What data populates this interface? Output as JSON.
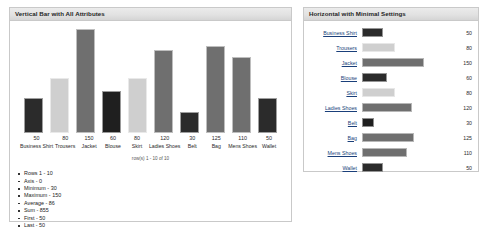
{
  "left_panel": {
    "title": "Vertical Bar with All Attributes",
    "row_count_text": "row(s) 1 - 10 of 10",
    "stats": [
      "Rows  1 - 10",
      "Axis - 0",
      "Minimum - 30",
      "Maximum - 150",
      "Average - 86",
      "Sum - 855",
      "First - 50",
      "Last - 50"
    ]
  },
  "right_panel": {
    "title": "Horizontal with Minimal Settings"
  },
  "colors": {
    "bar_dark": "#2b2b2b",
    "bar_light": "#cfcfcf",
    "bar_mid": "#6f6f6f",
    "bar_darker": "#1f1f1f",
    "panel_border": "#c9c9c9",
    "header_bg": "#e2e2e2",
    "link": "#1a3f7a"
  },
  "chart_data": [
    {
      "type": "bar",
      "orientation": "vertical",
      "title": "Vertical Bar with All Attributes",
      "xlabel": "",
      "ylabel": "",
      "ylim": [
        0,
        150
      ],
      "grid": false,
      "legend": "none",
      "categories": [
        "Business Shirt",
        "Trousers",
        "Jacket",
        "Blouse",
        "Skirt",
        "Ladies Shoes",
        "Belt",
        "Bag",
        "Mens Shoes",
        "Wallet"
      ],
      "values": [
        50,
        80,
        150,
        60,
        80,
        120,
        30,
        125,
        110,
        50
      ],
      "bar_colors": [
        "#2b2b2b",
        "#cfcfcf",
        "#6f6f6f",
        "#1f1f1f",
        "#cfcfcf",
        "#6f6f6f",
        "#2b2b2b",
        "#6f6f6f",
        "#6f6f6f",
        "#2b2b2b"
      ],
      "annotations": {
        "row_count": "row(s) 1 - 10 of 10",
        "axis": 0,
        "minimum": 30,
        "maximum": 150,
        "average": 86,
        "sum": 855,
        "first": 50,
        "last": 50,
        "rows": "1 - 10"
      }
    },
    {
      "type": "bar",
      "orientation": "horizontal",
      "title": "Horizontal with Minimal Settings",
      "xlabel": "",
      "ylabel": "",
      "xlim": [
        0,
        150
      ],
      "grid": false,
      "legend": "none",
      "categories": [
        "Business Shirt",
        "Trousers",
        "Jacket",
        "Blouse",
        "Skirt",
        "Ladies Shoes",
        "Belt",
        "Bag",
        "Mens Shoes",
        "Wallet"
      ],
      "values": [
        50,
        80,
        150,
        60,
        80,
        120,
        30,
        125,
        110,
        50
      ],
      "bar_colors": [
        "#2b2b2b",
        "#cfcfcf",
        "#6f6f6f",
        "#2b2b2b",
        "#cfcfcf",
        "#6f6f6f",
        "#1f1f1f",
        "#6f6f6f",
        "#6f6f6f",
        "#2b2b2b"
      ]
    }
  ]
}
